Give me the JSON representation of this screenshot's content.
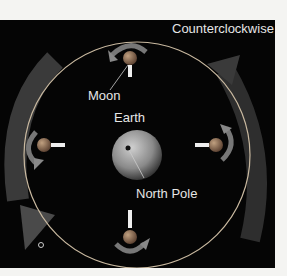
{
  "diagram": {
    "title": "Counterclockwise",
    "labels": {
      "moon": "Moon",
      "earth": "Earth",
      "north_pole": "North Pole"
    },
    "colors": {
      "background": "#050505",
      "orbit": "#c9b9a0",
      "arrow": "#7a7a7a",
      "moon": "#9a7a5a",
      "text": "#e6e6e6"
    }
  }
}
